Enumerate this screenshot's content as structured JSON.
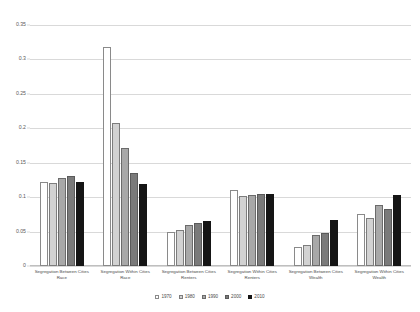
{
  "chart_data": {
    "type": "bar",
    "title": "",
    "xlabel": "",
    "ylabel": "",
    "ylim": [
      0,
      0.35
    ],
    "yticks": [
      "0",
      "0.05",
      "0.1",
      "0.15",
      "0.2",
      "0.25",
      "0.3",
      "0.35"
    ],
    "ytick_values": [
      0,
      0.05,
      0.1,
      0.15,
      0.2,
      0.25,
      0.3,
      0.35
    ],
    "grid": true,
    "legend_position": "bottom",
    "categories": [
      "Segregation Between Cities Race",
      "Segregation Within Cities Race",
      "Segregation Between Cities Renters",
      "Segregation Within Cities Renters",
      "Segregation Between Cities Wealth",
      "Segregation Within Cities Wealth"
    ],
    "category_lines": [
      [
        "Segregation Between Cities",
        "Race"
      ],
      [
        "Segregation Within Cities",
        "Race"
      ],
      [
        "Segregation Between Cities",
        "Renters"
      ],
      [
        "Segregation Within Cities",
        "Renters"
      ],
      [
        "Segregation Between Cities",
        "Wealth"
      ],
      [
        "Segregation Within Cities",
        "Wealth"
      ]
    ],
    "series": [
      {
        "name": "1970",
        "color": "#ffffff",
        "values": [
          0.122,
          0.318,
          0.05,
          0.11,
          0.028,
          0.075
        ]
      },
      {
        "name": "1980",
        "color": "#d2d2d2",
        "values": [
          0.121,
          0.207,
          0.053,
          0.102,
          0.031,
          0.07
        ]
      },
      {
        "name": "1990",
        "color": "#a8a8a8",
        "values": [
          0.128,
          0.172,
          0.059,
          0.103,
          0.045,
          0.089
        ]
      },
      {
        "name": "2000",
        "color": "#7a7a7a",
        "values": [
          0.131,
          0.135,
          0.063,
          0.104,
          0.048,
          0.083
        ]
      },
      {
        "name": "2010",
        "color": "#151515",
        "values": [
          0.122,
          0.119,
          0.065,
          0.105,
          0.067,
          0.103
        ]
      }
    ]
  }
}
